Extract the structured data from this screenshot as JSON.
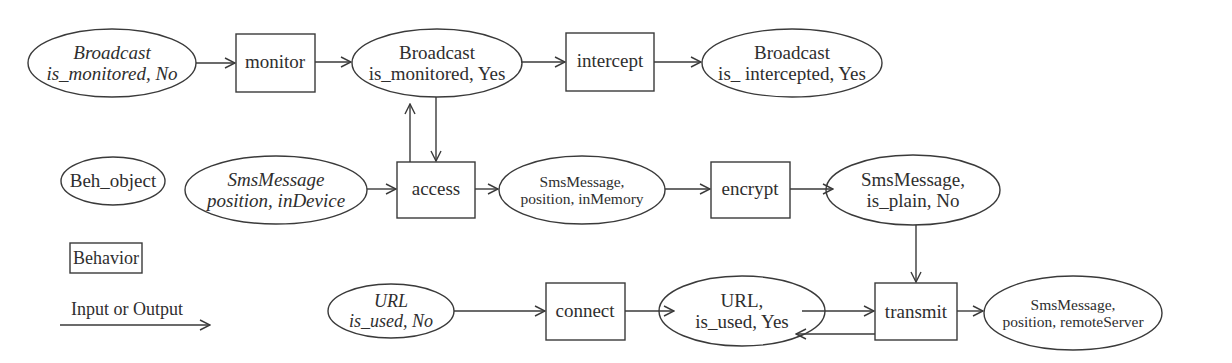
{
  "diagram": {
    "colors": {
      "stroke": "#3a3a3a",
      "text": "#2e2e2e",
      "background": "#ffffff"
    },
    "nodes": {
      "bc_not_monitored": {
        "type": "object",
        "italic": true,
        "lines": [
          "Broadcast",
          "is_monitored, No"
        ]
      },
      "monitor": {
        "type": "behavior",
        "label": "monitor"
      },
      "bc_monitored": {
        "type": "object",
        "italic": false,
        "lines": [
          "Broadcast",
          "is_monitored, Yes"
        ]
      },
      "intercept": {
        "type": "behavior",
        "label": "intercept"
      },
      "bc_intercepted": {
        "type": "object",
        "italic": false,
        "lines": [
          "Broadcast",
          "is_ intercepted, Yes"
        ]
      },
      "sms_in_device": {
        "type": "object",
        "italic": true,
        "lines": [
          "SmsMessage",
          "position, inDevice"
        ]
      },
      "access": {
        "type": "behavior",
        "label": "access"
      },
      "sms_in_memory": {
        "type": "object",
        "italic": false,
        "lines": [
          "SmsMessage,",
          "position, inMemory"
        ]
      },
      "encrypt": {
        "type": "behavior",
        "label": "encrypt"
      },
      "sms_not_plain": {
        "type": "object",
        "italic": false,
        "lines": [
          "SmsMessage,",
          "is_plain, No"
        ]
      },
      "url_not_used": {
        "type": "object",
        "italic": true,
        "lines": [
          "URL",
          "is_used, No"
        ]
      },
      "connect": {
        "type": "behavior",
        "label": "connect"
      },
      "url_used": {
        "type": "object",
        "italic": false,
        "lines": [
          "URL,",
          "is_used, Yes"
        ]
      },
      "transmit": {
        "type": "behavior",
        "label": "transmit"
      },
      "sms_remote": {
        "type": "object",
        "italic": false,
        "lines": [
          "SmsMessage,",
          "position, remoteServer"
        ]
      }
    },
    "edges": [
      {
        "from": "bc_not_monitored",
        "to": "monitor"
      },
      {
        "from": "monitor",
        "to": "bc_monitored"
      },
      {
        "from": "bc_monitored",
        "to": "intercept"
      },
      {
        "from": "intercept",
        "to": "bc_intercepted"
      },
      {
        "from": "bc_monitored",
        "to": "access"
      },
      {
        "from": "access",
        "to": "bc_monitored"
      },
      {
        "from": "sms_in_device",
        "to": "access"
      },
      {
        "from": "access",
        "to": "sms_in_memory"
      },
      {
        "from": "sms_in_memory",
        "to": "encrypt"
      },
      {
        "from": "encrypt",
        "to": "sms_not_plain"
      },
      {
        "from": "sms_not_plain",
        "to": "transmit"
      },
      {
        "from": "url_not_used",
        "to": "connect"
      },
      {
        "from": "connect",
        "to": "url_used"
      },
      {
        "from": "url_used",
        "to": "transmit"
      },
      {
        "from": "transmit",
        "to": "url_used"
      },
      {
        "from": "transmit",
        "to": "sms_remote"
      }
    ],
    "legend": {
      "object_label": "Beh_object",
      "behavior_label": "Behavior",
      "arrow_label": "Input or Output"
    }
  }
}
